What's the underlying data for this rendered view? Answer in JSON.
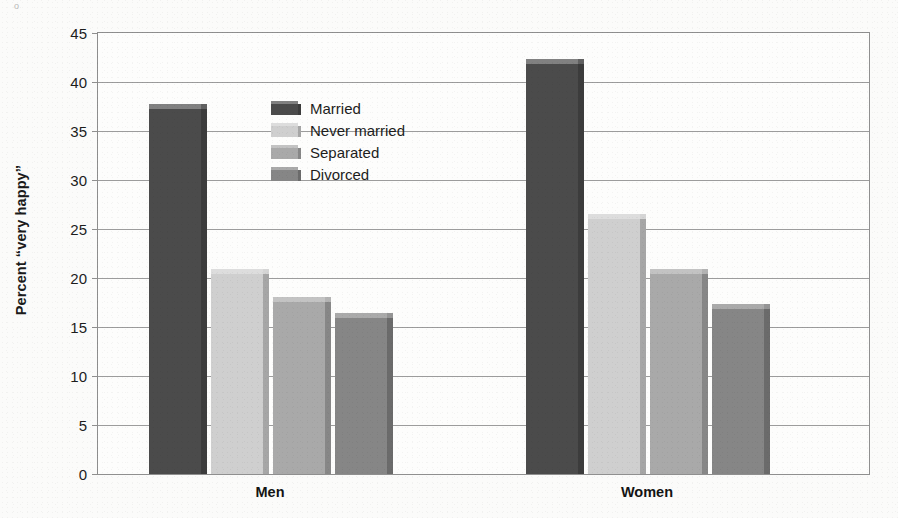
{
  "chart_data": {
    "type": "bar",
    "title": "",
    "subtitle": "",
    "xlabel": "",
    "ylabel": "Percent “very happy”",
    "categories": [
      "Men",
      "Women"
    ],
    "series": [
      {
        "name": "Married",
        "color": "#4b4b4b",
        "values": [
          37.2,
          41.8
        ]
      },
      {
        "name": "Never married",
        "color": "#cfcfcf",
        "values": [
          20.4,
          26.0
        ]
      },
      {
        "name": "Separated",
        "color": "#a9a9a9",
        "values": [
          17.6,
          20.4
        ]
      },
      {
        "name": "Divorced",
        "color": "#868686",
        "values": [
          15.9,
          16.8
        ]
      }
    ],
    "ylim": [
      0,
      45
    ],
    "yticks": [
      0,
      5,
      10,
      15,
      20,
      25,
      30,
      35,
      40,
      45
    ],
    "ytick_labels": [
      "0",
      "5",
      "10",
      "15",
      "20",
      "25",
      "30",
      "35",
      "40",
      "45"
    ],
    "grid": true,
    "grid_axis": "y",
    "legend": {
      "position": "inside-upper-center-left",
      "entries": [
        "Married",
        "Never married",
        "Separated",
        "Divorced"
      ]
    },
    "style": {
      "bar_3d": true,
      "frame": true,
      "frame_color": "#8f8f8f",
      "grid_color": "#9c9c9c",
      "background": "#fdfdfc",
      "page_background": "#fbfbfa"
    }
  }
}
